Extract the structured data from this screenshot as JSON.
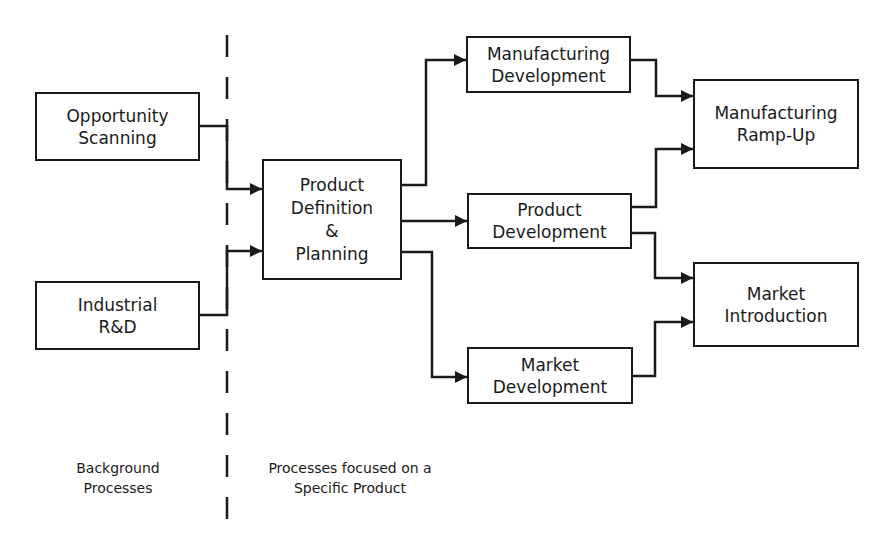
{
  "diagram": {
    "type": "process-flow",
    "divider": {
      "style": "dashed",
      "x": 227
    },
    "sections": [
      {
        "id": "background",
        "label": "Background\nProcesses"
      },
      {
        "id": "product",
        "label": "Processes focused on a\nSpecific Product"
      }
    ],
    "nodes": [
      {
        "id": "opportunity_scanning",
        "label": "Opportunity\nScanning",
        "section": "background"
      },
      {
        "id": "industrial_rd",
        "label": "Industrial\nR&D",
        "section": "background"
      },
      {
        "id": "product_definition",
        "label": "Product\nDefinition\n&\nPlanning",
        "section": "product"
      },
      {
        "id": "manufacturing_development",
        "label": "Manufacturing\nDevelopment",
        "section": "product"
      },
      {
        "id": "product_development",
        "label": "Product\nDevelopment",
        "section": "product"
      },
      {
        "id": "market_development",
        "label": "Market\nDevelopment",
        "section": "product"
      },
      {
        "id": "manufacturing_rampup",
        "label": "Manufacturing\nRamp-Up",
        "section": "product"
      },
      {
        "id": "market_introduction",
        "label": "Market\nIntroduction",
        "section": "product"
      }
    ],
    "edges": [
      {
        "from": "opportunity_scanning",
        "to": "product_definition"
      },
      {
        "from": "industrial_rd",
        "to": "product_definition"
      },
      {
        "from": "product_definition",
        "to": "manufacturing_development"
      },
      {
        "from": "product_definition",
        "to": "product_development"
      },
      {
        "from": "product_definition",
        "to": "market_development"
      },
      {
        "from": "manufacturing_development",
        "to": "manufacturing_rampup"
      },
      {
        "from": "product_development",
        "to": "manufacturing_rampup"
      },
      {
        "from": "product_development",
        "to": "market_introduction"
      },
      {
        "from": "market_development",
        "to": "market_introduction"
      }
    ]
  }
}
